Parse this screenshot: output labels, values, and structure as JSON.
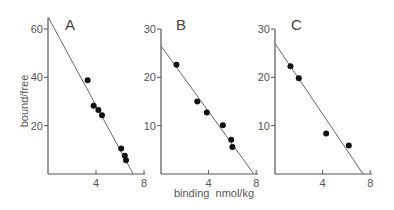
{
  "chart_data": [
    {
      "type": "scatter",
      "panel": "A",
      "title": "A",
      "xlabel": "",
      "ylabel": "bound/free",
      "xlim": [
        0,
        8
      ],
      "ylim": [
        0,
        65
      ],
      "xticks": [
        4,
        8
      ],
      "yticks": [
        20,
        40,
        60
      ],
      "points": [
        {
          "x": 3.3,
          "y": 38.8
        },
        {
          "x": 3.8,
          "y": 28.2
        },
        {
          "x": 4.2,
          "y": 26.5
        },
        {
          "x": 4.5,
          "y": 24.3
        },
        {
          "x": 6.1,
          "y": 10.6
        },
        {
          "x": 6.4,
          "y": 7.6
        },
        {
          "x": 6.5,
          "y": 5.7
        }
      ],
      "fit_line": {
        "y_intercept": 65,
        "x_intercept": 7.1
      }
    },
    {
      "type": "scatter",
      "panel": "B",
      "title": "B",
      "xlabel": "binding  nmol/kg",
      "ylabel": "",
      "xlim": [
        0,
        8
      ],
      "ylim": [
        0,
        30
      ],
      "xticks": [
        4,
        8
      ],
      "yticks": [
        10,
        20,
        30
      ],
      "points": [
        {
          "x": 1.3,
          "y": 22.6
        },
        {
          "x": 3.05,
          "y": 15.0
        },
        {
          "x": 3.85,
          "y": 12.7
        },
        {
          "x": 5.2,
          "y": 10.1
        },
        {
          "x": 5.9,
          "y": 7.1
        },
        {
          "x": 6.0,
          "y": 5.6
        }
      ],
      "fit_line": {
        "y_intercept": 26.5,
        "x_intercept": 7.8
      }
    },
    {
      "type": "scatter",
      "panel": "C",
      "title": "C",
      "xlabel": "",
      "ylabel": "",
      "xlim": [
        0,
        8
      ],
      "ylim": [
        0,
        30
      ],
      "xticks": [
        4,
        8
      ],
      "yticks": [
        10,
        20,
        30
      ],
      "points": [
        {
          "x": 1.3,
          "y": 22.3
        },
        {
          "x": 2.0,
          "y": 19.8
        },
        {
          "x": 4.3,
          "y": 8.4
        },
        {
          "x": 6.2,
          "y": 5.9
        }
      ],
      "fit_line": {
        "y_intercept": 27,
        "x_intercept": 7.4
      }
    }
  ]
}
